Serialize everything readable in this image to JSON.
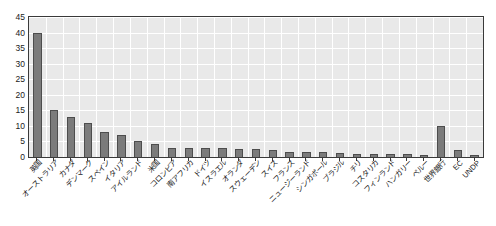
{
  "chart_data": {
    "type": "bar",
    "title": "",
    "subtitle": "",
    "xlabel": "",
    "ylabel": "",
    "ylim": [
      0,
      45
    ],
    "ytick_values": [
      0,
      5,
      10,
      15,
      20,
      25,
      30,
      35,
      40,
      45
    ],
    "ytick_labels": [
      "0",
      "5",
      "10",
      "15",
      "20",
      "25",
      "30",
      "35",
      "40",
      "45"
    ],
    "grid": true,
    "legend": false,
    "legend_position": "none",
    "categories": [
      "英国",
      "オーストラリア",
      "カナダ",
      "デンマーク",
      "スペイン",
      "イタリア",
      "アイルランド",
      "米国",
      "コロンビア",
      "南アフリカ",
      "ドイツ",
      "イスラエル",
      "オランダ",
      "スウェーデン",
      "スイス",
      "フランス",
      "ニュージーランド",
      "シンガポール",
      "ブラジル",
      "チリ",
      "コスタリカ",
      "フィンランド",
      "ハンガリー",
      "ペルー",
      "世界銀行",
      "EC",
      "UNDP"
    ],
    "values": [
      40,
      15,
      13,
      11,
      8,
      7,
      5,
      4.3,
      3,
      3,
      2.8,
      2.8,
      2.6,
      2.6,
      2.4,
      1.6,
      1.5,
      1.5,
      1.2,
      1.1,
      1.0,
      1.0,
      0.9,
      0.5,
      10,
      2.2,
      0.8
    ],
    "series_name": "",
    "bar_color": "#7b7b7b",
    "bar_edge_color": "#4d4d4d",
    "plot_bg_color": "#e9e9e9",
    "grid_color": "#ffffff",
    "axis_color": "#3a3a3a",
    "text_color": "#1a1a1a"
  }
}
